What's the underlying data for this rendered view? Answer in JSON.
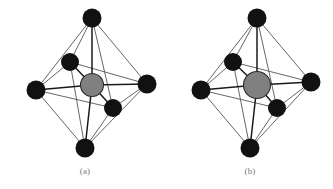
{
  "figure": {
    "type": "scientific-illustration",
    "background_color": "#ffffff",
    "panels": [
      {
        "id": "a",
        "caption": "(a)",
        "center_atom": {
          "name": "central-atom",
          "color": "#808080",
          "stroke": "#2b2b2b",
          "cx": 92,
          "cy": 85,
          "r": 11.5
        },
        "vertex_color": "#111111",
        "edge_color": "#555555",
        "bond_color": "#1a1a1a",
        "vertices": [
          {
            "name": "vertex-top",
            "cx": 92,
            "cy": 18,
            "r": 9.5
          },
          {
            "name": "vertex-bottom",
            "cx": 85,
            "cy": 148,
            "r": 9.5
          },
          {
            "name": "vertex-left",
            "cx": 36,
            "cy": 90,
            "r": 9.5
          },
          {
            "name": "vertex-right",
            "cx": 147,
            "cy": 84,
            "r": 9.5
          },
          {
            "name": "vertex-back-upper",
            "cx": 70,
            "cy": 62,
            "r": 9.0
          },
          {
            "name": "vertex-front-lower",
            "cx": 113,
            "cy": 108,
            "r": 9.0
          }
        ]
      },
      {
        "id": "b",
        "caption": "(b)",
        "center_atom": {
          "name": "central-atom",
          "color": "#808080",
          "stroke": "#2b2b2b",
          "cx": 257,
          "cy": 85,
          "r": 13.5
        },
        "vertex_color": "#111111",
        "edge_color": "#555555",
        "bond_color": "#1a1a1a",
        "vertices": [
          {
            "name": "vertex-top",
            "cx": 257,
            "cy": 18,
            "r": 9.5
          },
          {
            "name": "vertex-bottom",
            "cx": 250,
            "cy": 148,
            "r": 9.5
          },
          {
            "name": "vertex-left",
            "cx": 201,
            "cy": 90,
            "r": 9.5
          },
          {
            "name": "vertex-right",
            "cx": 311,
            "cy": 82,
            "r": 9.5
          },
          {
            "name": "vertex-back-upper",
            "cx": 233,
            "cy": 62,
            "r": 9.0
          },
          {
            "name": "vertex-front-lower",
            "cx": 277,
            "cy": 108,
            "r": 9.0
          }
        ]
      }
    ]
  }
}
